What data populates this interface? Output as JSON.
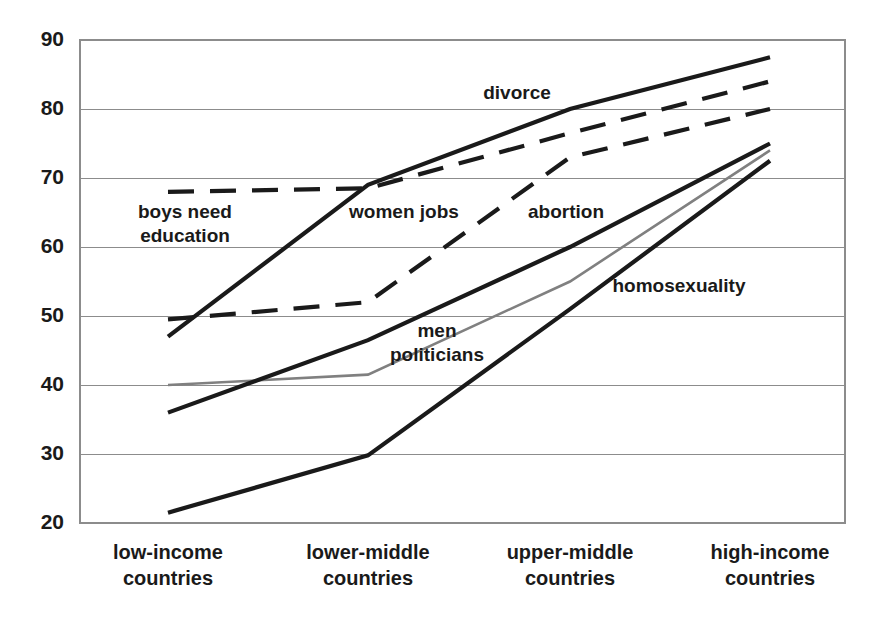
{
  "chart_data": {
    "type": "line",
    "title": "",
    "xlabel": "",
    "ylabel": "",
    "ylim": [
      20,
      90
    ],
    "yticks": [
      20,
      30,
      40,
      50,
      60,
      70,
      80,
      90
    ],
    "grid": true,
    "legend_position": "inline-annotations",
    "categories": [
      "low-income countries",
      "lower-middle countries",
      "upper-middle countries",
      "high-income countries"
    ],
    "category_lines": [
      [
        "low-income",
        "countries"
      ],
      [
        "lower-middle",
        "countries"
      ],
      [
        "upper-middle",
        "countries"
      ],
      [
        "high-income",
        "countries"
      ]
    ],
    "series": [
      {
        "name": "divorce",
        "label": "divorce",
        "values": [
          47,
          69,
          80,
          87.5
        ],
        "style": "solid",
        "color": "#1a1a1a",
        "width": 4.2,
        "label_x": 517,
        "label_y": 99
      },
      {
        "name": "women jobs",
        "label": "women jobs",
        "values": [
          68,
          68.5,
          76.5,
          84
        ],
        "style": "dashed",
        "color": "#1a1a1a",
        "width": 4.2,
        "label_x": 404,
        "label_y": 218
      },
      {
        "name": "boys need education",
        "label": "boys need education",
        "label_line1": "boys need",
        "label_line2": "education",
        "is_same_as": "women jobs",
        "label_x": 185,
        "label_y": 218
      },
      {
        "name": "abortion",
        "label": "abortion",
        "values": [
          49.5,
          52,
          73,
          80
        ],
        "style": "dashed",
        "color": "#1a1a1a",
        "width": 4.2,
        "label_x": 566,
        "label_y": 218
      },
      {
        "name": "men politicians",
        "label": "men politicians",
        "label_line1": "men",
        "label_line2": "politicians",
        "values": [
          40,
          41.5,
          55,
          74
        ],
        "style": "solid",
        "color": "#808080",
        "width": 2.6,
        "label_x": 437,
        "label_y": 337
      },
      {
        "name": "homosexuality",
        "label": "homosexuality",
        "values": [
          21.5,
          29.8,
          51,
          72.5
        ],
        "style": "solid",
        "color": "#1a1a1a",
        "width": 4.2,
        "label_x": 679,
        "label_y": 292
      },
      {
        "name": "unlabeled-dark-mid",
        "label": "",
        "values": [
          36,
          46.5,
          60,
          75
        ],
        "style": "solid",
        "color": "#1a1a1a",
        "width": 4.2
      }
    ],
    "colors": {
      "axis": "#8c8c8c",
      "grid": "#8c8c8c",
      "text": "#1a1a1a",
      "dark_series": "#1a1a1a",
      "gray_series": "#808080",
      "background": "#ffffff"
    }
  },
  "geometry": {
    "plot_left": 80,
    "plot_right": 845,
    "plot_top": 40,
    "plot_bottom": 523,
    "category_x": [
      168,
      368,
      570,
      770
    ]
  }
}
